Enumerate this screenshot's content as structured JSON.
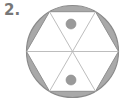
{
  "problem": {
    "number_label": "2."
  },
  "diagram": {
    "circle": {
      "cx": 72.5,
      "cy": 51.5,
      "r": 46
    },
    "hexagon_vertices": [
      [
        26.5,
        51.5
      ],
      [
        49.5,
        11.7
      ],
      [
        95.5,
        11.7
      ],
      [
        118.5,
        51.5
      ],
      [
        95.5,
        91.3
      ],
      [
        49.5,
        91.3
      ]
    ],
    "dots": [
      {
        "cx": 71,
        "cy": 24,
        "r": 5
      },
      {
        "cx": 71,
        "cy": 80,
        "r": 5
      }
    ],
    "colors": {
      "shade": "#a9a9a9",
      "stroke": "#8a8a8a",
      "line": "#b5b5b5",
      "dot": "#9a9a9a",
      "background": "#ffffff"
    }
  }
}
